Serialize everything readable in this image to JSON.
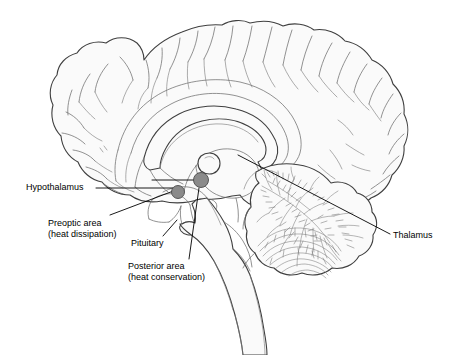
{
  "figure": {
    "background_color": "#ffffff",
    "outline_color": "#3c3c3c",
    "fill_color": "#fafafa",
    "marker_color": "#8a8a8a",
    "marker_outline_color": "#4a4a4a",
    "leader_line_color": "#000000",
    "text_color": "#000000"
  },
  "labels": {
    "hypothalamus": {
      "text": "Hypothalamus",
      "lines": [
        "Hypothalamus"
      ]
    },
    "preoptic": {
      "text": "Preoptic area (heat dissipation)",
      "lines": [
        "Preoptic area",
        "(heat dissipation)"
      ]
    },
    "pituitary": {
      "text": "Pituitary",
      "lines": [
        "Pituitary"
      ]
    },
    "posterior": {
      "text": "Posterior area (heat conservation)",
      "lines": [
        "Posterior area",
        "(heat conservation)"
      ]
    },
    "thalamus": {
      "text": "Thalamus",
      "lines": [
        "Thalamus"
      ]
    }
  },
  "markers": [
    {
      "name": "preoptic-area-marker",
      "cx": 178,
      "cy": 192,
      "r": 6.5
    },
    {
      "name": "posterior-hypothalamus-marker",
      "cx": 201,
      "cy": 180,
      "r": 7.5
    }
  ],
  "structures": [
    {
      "name": "cerebral-cortex"
    },
    {
      "name": "corpus-callosum"
    },
    {
      "name": "thalamus"
    },
    {
      "name": "hypothalamus"
    },
    {
      "name": "pituitary-gland"
    },
    {
      "name": "cerebellum"
    },
    {
      "name": "brainstem"
    },
    {
      "name": "spinal-cord"
    }
  ]
}
